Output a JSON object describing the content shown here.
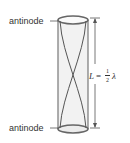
{
  "diagram": {
    "type": "standing-wave-open-tube",
    "labels": {
      "top": "antinode",
      "bottom": "antinode"
    },
    "equation": {
      "lhs": "L",
      "equals": "=",
      "frac_num": "1",
      "frac_den": "2",
      "rhs": "λ"
    },
    "colors": {
      "tube_outline": "#666666",
      "tube_fill": "#ececec",
      "wave": "#555555",
      "text": "#333333"
    }
  }
}
